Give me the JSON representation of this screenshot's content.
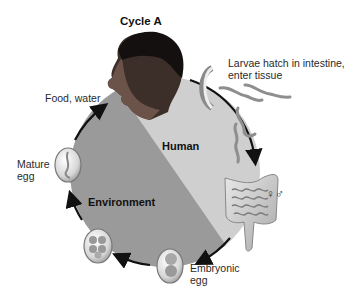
{
  "title": "Cycle A",
  "regions": {
    "human": "Human",
    "environment": "Environment"
  },
  "stages": [
    {
      "id": "food-water",
      "label": "Food, water"
    },
    {
      "id": "larvae",
      "label_line1": "Larvae hatch in intestine,",
      "label_line2": "enter tissue"
    },
    {
      "id": "adults",
      "label": "♀♂"
    },
    {
      "id": "embryonic-egg",
      "label_line1": "Embryonic",
      "label_line2": "egg"
    },
    {
      "id": "developing-egg",
      "label": ""
    },
    {
      "id": "mature-egg",
      "label_line1": "Mature",
      "label_line2": "egg"
    }
  ],
  "colors": {
    "human_region": "#cfcfcf",
    "environment_region": "#9a9a9a",
    "cycle_arrow": "#111111",
    "background": "#ffffff"
  }
}
